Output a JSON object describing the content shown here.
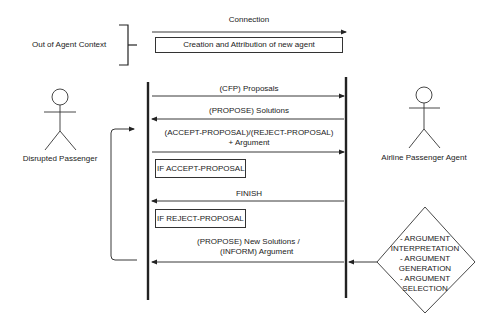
{
  "context": {
    "label": "Out of Agent Context",
    "connection_label": "Connection",
    "creation_box": "Creation and Attribution of new agent"
  },
  "actors": [
    {
      "name": "Disrupted Passenger"
    },
    {
      "name": "Airline Passenger Agent"
    }
  ],
  "messages": [
    {
      "label": "(CFP) Proposals",
      "direction": "right"
    },
    {
      "label": "(PROPOSE) Solutions",
      "direction": "left"
    },
    {
      "label_line1": "(ACCEPT-PROPOSAL)/(REJECT-PROPOSAL)",
      "label_line2": "+ Argument",
      "direction": "right"
    },
    {
      "label": "FINISH",
      "direction": "left"
    },
    {
      "label_line1": "(PROPOSE) New Solutions /",
      "label_line2": "(INFORM) Argument",
      "direction": "left"
    }
  ],
  "conditions": [
    {
      "label": "IF ACCEPT-PROPOSAL"
    },
    {
      "label": "IF REJECT-PROPOSAL"
    }
  ],
  "decision": {
    "lines": [
      "- ARGUMENT",
      "INTERPRETATION",
      "- ARGUMENT",
      "GENERATION",
      "- ARGUMENT",
      "SELECTION"
    ]
  }
}
